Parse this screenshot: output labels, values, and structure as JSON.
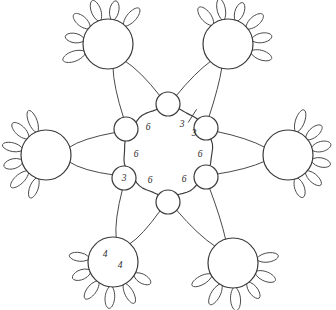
{
  "diagram": {
    "background_color": "#ffffff",
    "ink_color": "#3a3a3a",
    "center": {
      "x": 168,
      "y": 152
    },
    "ring": {
      "name": "central-cycle",
      "radius": 44,
      "tick_mark_present": true,
      "tick_label_left": "3",
      "tick_label_right": "3"
    },
    "edge_labels": [
      {
        "id": "label-top-left",
        "text": "6",
        "x": 148,
        "y": 128
      },
      {
        "id": "label-top-right-a",
        "text": "3",
        "x": 182,
        "y": 125
      },
      {
        "id": "label-top-right-b",
        "text": "3",
        "x": 194,
        "y": 134
      },
      {
        "id": "label-left",
        "text": "6",
        "x": 136,
        "y": 155
      },
      {
        "id": "label-right",
        "text": "6",
        "x": 200,
        "y": 155
      },
      {
        "id": "label-bottom-left",
        "text": "6",
        "x": 150,
        "y": 181
      },
      {
        "id": "label-bottom-right",
        "text": "6",
        "x": 184,
        "y": 180
      }
    ],
    "hub_nodes": [
      {
        "id": "hub-top",
        "label": "",
        "x": 168,
        "y": 104,
        "r": 12
      },
      {
        "id": "hub-upper-right",
        "label": "",
        "x": 206,
        "y": 128,
        "r": 12
      },
      {
        "id": "hub-lower-right",
        "label": "",
        "x": 206,
        "y": 177,
        "r": 12
      },
      {
        "id": "hub-bottom",
        "label": "",
        "x": 168,
        "y": 202,
        "r": 12
      },
      {
        "id": "hub-lower-left",
        "label": "3",
        "x": 124,
        "y": 178,
        "r": 12
      },
      {
        "id": "hub-upper-left",
        "label": "",
        "x": 126,
        "y": 129,
        "r": 12
      }
    ],
    "flowers": [
      {
        "id": "flower-top-left",
        "x": 108,
        "y": 44,
        "r": 25,
        "label_a": "",
        "label_b": "",
        "petal_start_deg": 160,
        "petal_span_deg": 150,
        "petal_count": 6
      },
      {
        "id": "flower-top-right",
        "x": 228,
        "y": 44,
        "r": 25,
        "label_a": "",
        "label_b": "",
        "petal_start_deg": -130,
        "petal_span_deg": 150,
        "petal_count": 6
      },
      {
        "id": "flower-left",
        "x": 46,
        "y": 155,
        "r": 25,
        "label_a": "",
        "label_b": "",
        "petal_start_deg": 110,
        "petal_span_deg": 140,
        "petal_count": 6
      },
      {
        "id": "flower-right",
        "x": 288,
        "y": 155,
        "r": 25,
        "label_a": "",
        "label_b": "",
        "petal_start_deg": -70,
        "petal_span_deg": 140,
        "petal_count": 6
      },
      {
        "id": "flower-bottom-left",
        "x": 113,
        "y": 262,
        "r": 25,
        "label_a": "4",
        "label_b": "4",
        "petal_start_deg": 30,
        "petal_span_deg": 160,
        "petal_count": 6
      },
      {
        "id": "flower-bottom-right",
        "x": 233,
        "y": 263,
        "r": 25,
        "label_a": "",
        "label_b": "",
        "petal_start_deg": -10,
        "petal_span_deg": 160,
        "petal_count": 6
      }
    ],
    "flower_labels": [
      {
        "id": "flower-label-bl-a",
        "text": "4",
        "x": 105,
        "y": 255
      },
      {
        "id": "flower-label-bl-b",
        "text": "4",
        "x": 120,
        "y": 266
      }
    ],
    "connectors": [
      {
        "id": "conn-tl-to-hub-top",
        "from": "flower-top-left",
        "to": "hub-top"
      },
      {
        "id": "conn-tl-to-hub-upper-left",
        "from": "flower-top-left",
        "to": "hub-upper-left"
      },
      {
        "id": "conn-tr-to-hub-top",
        "from": "flower-top-right",
        "to": "hub-top"
      },
      {
        "id": "conn-tr-to-hub-upper-right",
        "from": "flower-top-right",
        "to": "hub-upper-right"
      },
      {
        "id": "conn-left-to-hub-upper-left",
        "from": "flower-left",
        "to": "hub-upper-left"
      },
      {
        "id": "conn-left-to-hub-lower-left",
        "from": "flower-left",
        "to": "hub-lower-left"
      },
      {
        "id": "conn-right-to-hub-upper-right",
        "from": "flower-right",
        "to": "hub-upper-right"
      },
      {
        "id": "conn-right-to-hub-lower-right",
        "from": "flower-right",
        "to": "hub-lower-right"
      },
      {
        "id": "conn-bl-to-hub-lower-left",
        "from": "flower-bottom-left",
        "to": "hub-lower-left"
      },
      {
        "id": "conn-bl-to-hub-bottom",
        "from": "flower-bottom-left",
        "to": "hub-bottom"
      },
      {
        "id": "conn-br-to-hub-bottom",
        "from": "flower-bottom-right",
        "to": "hub-bottom"
      },
      {
        "id": "conn-br-to-hub-lower-right",
        "from": "flower-bottom-right",
        "to": "hub-lower-right"
      }
    ]
  }
}
